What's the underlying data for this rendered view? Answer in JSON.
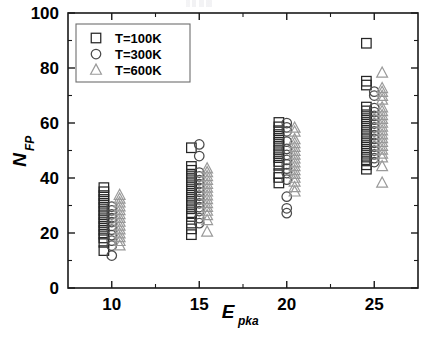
{
  "chart_data": {
    "type": "scatter",
    "title": "",
    "xlabel": "E_pka",
    "xlabel_main": "E",
    "xlabel_sub": "pka",
    "ylabel": "N_FP",
    "ylabel_main": "N",
    "ylabel_sub": "FP",
    "xlim": [
      7.5,
      27.5
    ],
    "ylim": [
      0,
      100
    ],
    "xticks": [
      10,
      15,
      20,
      25
    ],
    "xtick_labels": [
      "10",
      "15",
      "20",
      "25"
    ],
    "yticks": [
      0,
      20,
      40,
      60,
      80,
      100
    ],
    "ytick_labels": [
      "0",
      "20",
      "40",
      "60",
      "80",
      "100"
    ],
    "x_minor_ticks": [
      12.5,
      17.5,
      22.5
    ],
    "y_minor_ticks": [
      10,
      30,
      50,
      70,
      90
    ],
    "grid": false,
    "legend_position": "upper-left",
    "categories": [
      10,
      15,
      20,
      25
    ],
    "series": [
      {
        "name": "T=100K",
        "marker": "square",
        "color": "#262626",
        "points": [
          {
            "x": 9.55,
            "y": 36.5
          },
          {
            "x": 9.55,
            "y": 35.0
          },
          {
            "x": 9.55,
            "y": 33.6
          },
          {
            "x": 9.55,
            "y": 32.2
          },
          {
            "x": 9.55,
            "y": 30.8
          },
          {
            "x": 9.55,
            "y": 29.4
          },
          {
            "x": 9.55,
            "y": 28.0
          },
          {
            "x": 9.55,
            "y": 26.6
          },
          {
            "x": 9.55,
            "y": 25.2
          },
          {
            "x": 9.55,
            "y": 23.8
          },
          {
            "x": 9.55,
            "y": 22.4
          },
          {
            "x": 9.55,
            "y": 21.0
          },
          {
            "x": 9.55,
            "y": 19.6
          },
          {
            "x": 9.55,
            "y": 18.2
          },
          {
            "x": 9.55,
            "y": 16.6
          },
          {
            "x": 9.55,
            "y": 13.6
          },
          {
            "x": 14.55,
            "y": 51.0
          },
          {
            "x": 14.55,
            "y": 44.2
          },
          {
            "x": 14.55,
            "y": 42.8
          },
          {
            "x": 14.55,
            "y": 41.4
          },
          {
            "x": 14.55,
            "y": 40.0
          },
          {
            "x": 14.55,
            "y": 38.6
          },
          {
            "x": 14.55,
            "y": 37.2
          },
          {
            "x": 14.55,
            "y": 35.8
          },
          {
            "x": 14.55,
            "y": 34.4
          },
          {
            "x": 14.55,
            "y": 33.0
          },
          {
            "x": 14.55,
            "y": 31.6
          },
          {
            "x": 14.55,
            "y": 30.2
          },
          {
            "x": 14.55,
            "y": 28.8
          },
          {
            "x": 14.55,
            "y": 27.4
          },
          {
            "x": 14.55,
            "y": 26.0
          },
          {
            "x": 14.55,
            "y": 23.6
          },
          {
            "x": 14.55,
            "y": 21.5
          },
          {
            "x": 14.55,
            "y": 19.4
          },
          {
            "x": 19.55,
            "y": 60.2
          },
          {
            "x": 19.55,
            "y": 58.6
          },
          {
            "x": 19.55,
            "y": 57.2
          },
          {
            "x": 19.55,
            "y": 55.8
          },
          {
            "x": 19.55,
            "y": 54.4
          },
          {
            "x": 19.55,
            "y": 53.0
          },
          {
            "x": 19.55,
            "y": 51.6
          },
          {
            "x": 19.55,
            "y": 50.2
          },
          {
            "x": 19.55,
            "y": 48.8
          },
          {
            "x": 19.55,
            "y": 47.4
          },
          {
            "x": 19.55,
            "y": 46.0
          },
          {
            "x": 19.55,
            "y": 44.6
          },
          {
            "x": 19.55,
            "y": 41.6
          },
          {
            "x": 19.55,
            "y": 40.2
          },
          {
            "x": 19.55,
            "y": 38.2
          },
          {
            "x": 24.55,
            "y": 89.0
          },
          {
            "x": 24.55,
            "y": 75.2
          },
          {
            "x": 24.55,
            "y": 73.8
          },
          {
            "x": 24.55,
            "y": 65.8
          },
          {
            "x": 24.55,
            "y": 64.4
          },
          {
            "x": 24.55,
            "y": 63.0
          },
          {
            "x": 24.55,
            "y": 61.6
          },
          {
            "x": 24.55,
            "y": 60.2
          },
          {
            "x": 24.55,
            "y": 58.8
          },
          {
            "x": 24.55,
            "y": 57.4
          },
          {
            "x": 24.55,
            "y": 56.0
          },
          {
            "x": 24.55,
            "y": 54.6
          },
          {
            "x": 24.55,
            "y": 53.2
          },
          {
            "x": 24.55,
            "y": 51.8
          },
          {
            "x": 24.55,
            "y": 50.4
          },
          {
            "x": 24.55,
            "y": 49.0
          },
          {
            "x": 24.55,
            "y": 47.6
          },
          {
            "x": 24.55,
            "y": 46.2
          },
          {
            "x": 24.55,
            "y": 44.8
          },
          {
            "x": 24.55,
            "y": 43.2
          }
        ]
      },
      {
        "name": "T=300K",
        "marker": "circle",
        "color": "#4a4a4a",
        "points": [
          {
            "x": 10.0,
            "y": 29.6
          },
          {
            "x": 10.0,
            "y": 28.2
          },
          {
            "x": 10.0,
            "y": 26.8
          },
          {
            "x": 10.0,
            "y": 25.4
          },
          {
            "x": 10.0,
            "y": 24.0
          },
          {
            "x": 10.0,
            "y": 22.6
          },
          {
            "x": 10.0,
            "y": 21.2
          },
          {
            "x": 10.0,
            "y": 19.2
          },
          {
            "x": 10.0,
            "y": 17.2
          },
          {
            "x": 10.0,
            "y": 15.4
          },
          {
            "x": 10.0,
            "y": 11.8
          },
          {
            "x": 15.0,
            "y": 52.2
          },
          {
            "x": 15.0,
            "y": 48.0
          },
          {
            "x": 15.0,
            "y": 42.0
          },
          {
            "x": 15.0,
            "y": 40.6
          },
          {
            "x": 15.0,
            "y": 39.2
          },
          {
            "x": 15.0,
            "y": 37.8
          },
          {
            "x": 15.0,
            "y": 36.4
          },
          {
            "x": 15.0,
            "y": 35.0
          },
          {
            "x": 15.0,
            "y": 33.6
          },
          {
            "x": 15.0,
            "y": 32.2
          },
          {
            "x": 15.0,
            "y": 30.8
          },
          {
            "x": 15.0,
            "y": 29.4
          },
          {
            "x": 15.0,
            "y": 28.0
          },
          {
            "x": 15.0,
            "y": 25.4
          },
          {
            "x": 15.0,
            "y": 23.6
          },
          {
            "x": 20.0,
            "y": 60.0
          },
          {
            "x": 20.0,
            "y": 58.4
          },
          {
            "x": 20.0,
            "y": 57.0
          },
          {
            "x": 20.0,
            "y": 53.2
          },
          {
            "x": 20.0,
            "y": 50.6
          },
          {
            "x": 20.0,
            "y": 48.4
          },
          {
            "x": 20.0,
            "y": 46.6
          },
          {
            "x": 20.0,
            "y": 45.0
          },
          {
            "x": 20.0,
            "y": 43.4
          },
          {
            "x": 20.0,
            "y": 41.8
          },
          {
            "x": 20.0,
            "y": 39.4
          },
          {
            "x": 20.0,
            "y": 33.2
          },
          {
            "x": 20.0,
            "y": 29.0
          },
          {
            "x": 20.0,
            "y": 27.2
          },
          {
            "x": 25.0,
            "y": 71.4
          },
          {
            "x": 25.0,
            "y": 70.0
          },
          {
            "x": 25.0,
            "y": 65.4
          },
          {
            "x": 25.0,
            "y": 64.0
          },
          {
            "x": 25.0,
            "y": 62.6
          },
          {
            "x": 25.0,
            "y": 61.2
          },
          {
            "x": 25.0,
            "y": 59.8
          },
          {
            "x": 25.0,
            "y": 58.4
          },
          {
            "x": 25.0,
            "y": 57.0
          },
          {
            "x": 25.0,
            "y": 55.6
          },
          {
            "x": 25.0,
            "y": 54.2
          },
          {
            "x": 25.0,
            "y": 52.8
          },
          {
            "x": 25.0,
            "y": 51.4
          },
          {
            "x": 25.0,
            "y": 50.0
          },
          {
            "x": 25.0,
            "y": 48.6
          },
          {
            "x": 25.0,
            "y": 47.2
          },
          {
            "x": 25.0,
            "y": 45.8
          }
        ]
      },
      {
        "name": "T=600K",
        "marker": "triangle",
        "color": "#9a9a9a",
        "points": [
          {
            "x": 10.45,
            "y": 33.8
          },
          {
            "x": 10.45,
            "y": 32.4
          },
          {
            "x": 10.45,
            "y": 31.0
          },
          {
            "x": 10.45,
            "y": 29.6
          },
          {
            "x": 10.45,
            "y": 28.2
          },
          {
            "x": 10.45,
            "y": 26.8
          },
          {
            "x": 10.45,
            "y": 25.4
          },
          {
            "x": 10.45,
            "y": 24.0
          },
          {
            "x": 10.45,
            "y": 22.6
          },
          {
            "x": 10.45,
            "y": 21.2
          },
          {
            "x": 10.45,
            "y": 19.8
          },
          {
            "x": 10.45,
            "y": 18.4
          },
          {
            "x": 10.45,
            "y": 17.0
          },
          {
            "x": 10.45,
            "y": 15.4
          },
          {
            "x": 15.45,
            "y": 43.4
          },
          {
            "x": 15.45,
            "y": 42.0
          },
          {
            "x": 15.45,
            "y": 40.6
          },
          {
            "x": 15.45,
            "y": 39.2
          },
          {
            "x": 15.45,
            "y": 37.8
          },
          {
            "x": 15.45,
            "y": 36.4
          },
          {
            "x": 15.45,
            "y": 35.0
          },
          {
            "x": 15.45,
            "y": 33.6
          },
          {
            "x": 15.45,
            "y": 32.2
          },
          {
            "x": 15.45,
            "y": 30.8
          },
          {
            "x": 15.45,
            "y": 29.4
          },
          {
            "x": 15.45,
            "y": 28.0
          },
          {
            "x": 15.45,
            "y": 26.4
          },
          {
            "x": 15.45,
            "y": 24.6
          },
          {
            "x": 15.45,
            "y": 20.4
          },
          {
            "x": 20.45,
            "y": 58.2
          },
          {
            "x": 20.45,
            "y": 56.8
          },
          {
            "x": 20.45,
            "y": 54.0
          },
          {
            "x": 20.45,
            "y": 52.6
          },
          {
            "x": 20.45,
            "y": 51.2
          },
          {
            "x": 20.45,
            "y": 49.8
          },
          {
            "x": 20.45,
            "y": 48.4
          },
          {
            "x": 20.45,
            "y": 47.0
          },
          {
            "x": 20.45,
            "y": 45.6
          },
          {
            "x": 20.45,
            "y": 44.2
          },
          {
            "x": 20.45,
            "y": 42.8
          },
          {
            "x": 20.45,
            "y": 41.4
          },
          {
            "x": 20.45,
            "y": 40.0
          },
          {
            "x": 20.45,
            "y": 38.6
          },
          {
            "x": 20.45,
            "y": 36.6
          },
          {
            "x": 20.45,
            "y": 35.0
          },
          {
            "x": 25.45,
            "y": 78.2
          },
          {
            "x": 25.45,
            "y": 72.6
          },
          {
            "x": 25.45,
            "y": 71.2
          },
          {
            "x": 25.45,
            "y": 69.8
          },
          {
            "x": 25.45,
            "y": 68.4
          },
          {
            "x": 25.45,
            "y": 65.6
          },
          {
            "x": 25.45,
            "y": 64.2
          },
          {
            "x": 25.45,
            "y": 62.8
          },
          {
            "x": 25.45,
            "y": 61.4
          },
          {
            "x": 25.45,
            "y": 60.0
          },
          {
            "x": 25.45,
            "y": 58.6
          },
          {
            "x": 25.45,
            "y": 57.2
          },
          {
            "x": 25.45,
            "y": 55.8
          },
          {
            "x": 25.45,
            "y": 54.4
          },
          {
            "x": 25.45,
            "y": 53.0
          },
          {
            "x": 25.45,
            "y": 51.6
          },
          {
            "x": 25.45,
            "y": 50.2
          },
          {
            "x": 25.45,
            "y": 48.8
          },
          {
            "x": 25.45,
            "y": 47.4
          },
          {
            "x": 25.45,
            "y": 44.2
          },
          {
            "x": 25.45,
            "y": 38.2
          }
        ]
      }
    ],
    "legend": [
      {
        "label": "T=100K",
        "marker": "square",
        "color": "#262626"
      },
      {
        "label": "T=300K",
        "marker": "circle",
        "color": "#4a4a4a"
      },
      {
        "label": "T=600K",
        "marker": "triangle",
        "color": "#9a9a9a"
      }
    ]
  }
}
